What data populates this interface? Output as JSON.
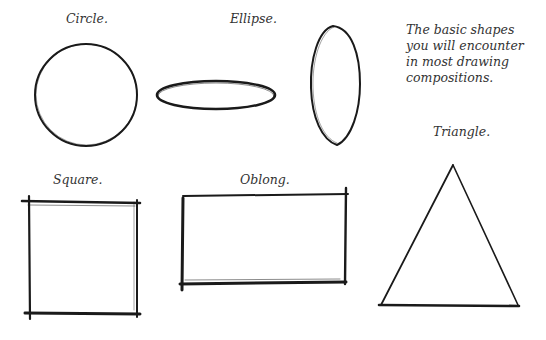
{
  "caption": {
    "lines": [
      "The basic shapes",
      "you will encounter",
      "in most drawing",
      "compositions."
    ]
  },
  "shapes": [
    {
      "name": "circle",
      "label": "Circle."
    },
    {
      "name": "ellipse",
      "label": "Ellipse."
    },
    {
      "name": "square",
      "label": "Square."
    },
    {
      "name": "oblong",
      "label": "Oblong."
    },
    {
      "name": "triangle",
      "label": "Triangle."
    }
  ],
  "colors": {
    "stroke": "#1a1a1a",
    "text": "#333333",
    "background": "#ffffff"
  }
}
